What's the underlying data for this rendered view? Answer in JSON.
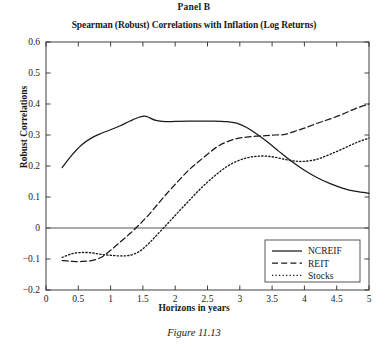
{
  "panel": {
    "label": "Panel B"
  },
  "figure": {
    "caption": "Figure 11.13"
  },
  "chart_data": {
    "type": "line",
    "title": "Spearman (Robust) Correlations with Inflation (Log Returns)",
    "xlabel": "Horizons in years",
    "ylabel": "Robust Correlations",
    "xlim": [
      0,
      5
    ],
    "ylim": [
      -0.2,
      0.6
    ],
    "xticks": [
      0,
      0.5,
      1,
      1.5,
      2,
      2.5,
      3,
      3.5,
      4,
      4.5,
      5
    ],
    "xticklabels": [
      "0",
      "0.5",
      "1",
      "1.5",
      "2",
      "2.5",
      "3",
      "3.5",
      "4",
      "4.5",
      "5"
    ],
    "yticks": [
      -0.2,
      -0.1,
      0,
      0.1,
      0.2,
      0.3,
      0.4,
      0.5,
      0.6
    ],
    "yticklabels": [
      "−0.2",
      "−0.1",
      "0",
      "0.1",
      "0.2",
      "0.3",
      "0.4",
      "0.5",
      "0.6"
    ],
    "grid": false,
    "zero_line": true,
    "legend_position": "lower right",
    "series": [
      {
        "name": "NCREIF",
        "style": "solid",
        "color": "#1a1a1a",
        "x": [
          0.25,
          0.4,
          0.55,
          0.7,
          0.85,
          1.0,
          1.15,
          1.3,
          1.45,
          1.55,
          1.7,
          1.85,
          2.0,
          2.2,
          2.4,
          2.6,
          2.8,
          2.95,
          3.1,
          3.25,
          3.4,
          3.6,
          3.8,
          4.0,
          4.2,
          4.4,
          4.6,
          4.8,
          5.0
        ],
        "y": [
          0.195,
          0.235,
          0.268,
          0.29,
          0.305,
          0.317,
          0.33,
          0.345,
          0.358,
          0.36,
          0.347,
          0.343,
          0.344,
          0.345,
          0.345,
          0.345,
          0.343,
          0.338,
          0.325,
          0.305,
          0.282,
          0.248,
          0.215,
          0.186,
          0.162,
          0.143,
          0.128,
          0.118,
          0.112
        ]
      },
      {
        "name": "REIT",
        "style": "dashed",
        "color": "#1a1a1a",
        "x": [
          0.25,
          0.4,
          0.55,
          0.7,
          0.85,
          1.0,
          1.15,
          1.3,
          1.45,
          1.6,
          1.75,
          1.9,
          2.05,
          2.2,
          2.35,
          2.5,
          2.65,
          2.8,
          2.95,
          3.1,
          3.25,
          3.4,
          3.55,
          3.7,
          3.85,
          4.0,
          4.2,
          4.4,
          4.6,
          4.8,
          5.0
        ],
        "y": [
          -0.105,
          -0.108,
          -0.108,
          -0.105,
          -0.095,
          -0.072,
          -0.045,
          -0.018,
          0.012,
          0.045,
          0.082,
          0.118,
          0.152,
          0.185,
          0.212,
          0.238,
          0.262,
          0.278,
          0.288,
          0.293,
          0.296,
          0.298,
          0.3,
          0.302,
          0.312,
          0.322,
          0.338,
          0.352,
          0.368,
          0.386,
          0.4
        ]
      },
      {
        "name": "Stocks",
        "style": "dotted",
        "color": "#1a1a1a",
        "x": [
          0.25,
          0.4,
          0.55,
          0.7,
          0.85,
          1.0,
          1.15,
          1.3,
          1.45,
          1.6,
          1.75,
          1.9,
          2.05,
          2.2,
          2.35,
          2.5,
          2.65,
          2.8,
          2.95,
          3.1,
          3.25,
          3.4,
          3.55,
          3.7,
          3.85,
          4.0,
          4.2,
          4.4,
          4.6,
          4.8,
          5.0
        ],
        "y": [
          -0.095,
          -0.083,
          -0.079,
          -0.08,
          -0.085,
          -0.088,
          -0.09,
          -0.088,
          -0.075,
          -0.048,
          -0.015,
          0.018,
          0.052,
          0.085,
          0.118,
          0.148,
          0.175,
          0.198,
          0.215,
          0.226,
          0.231,
          0.232,
          0.228,
          0.221,
          0.216,
          0.215,
          0.222,
          0.238,
          0.256,
          0.275,
          0.29
        ]
      }
    ]
  }
}
